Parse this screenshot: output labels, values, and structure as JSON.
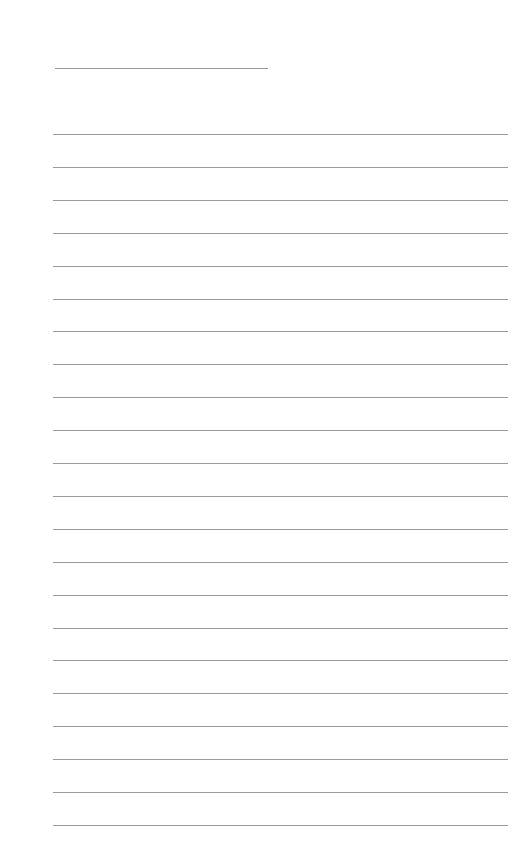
{
  "page": {
    "type": "lined-paper",
    "background": "#ffffff",
    "line_color": "#9a9a9a",
    "title_line": {
      "x": 55,
      "y": 68,
      "width": 213
    },
    "ruled_lines": {
      "count": 22,
      "x": 53,
      "width": 455,
      "start_y": 134,
      "spacing": 32.9
    }
  }
}
